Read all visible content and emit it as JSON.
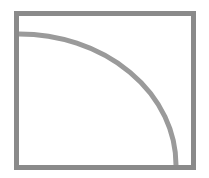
{
  "diagram": {
    "canvas": {
      "width": 209,
      "height": 178,
      "background": "#ffffff"
    },
    "frame": {
      "x": 16.5,
      "y": 13.5,
      "width": 177,
      "height": 154,
      "stroke": "#8a8a8a",
      "stroke_width": 5
    },
    "arc": {
      "type": "quarter-ellipse",
      "center": [
        19,
        165
      ],
      "rx": 157,
      "ry": 131,
      "start": [
        19,
        34
      ],
      "end": [
        176,
        165
      ],
      "stroke": "#9a9a9a",
      "stroke_width": 5
    }
  }
}
